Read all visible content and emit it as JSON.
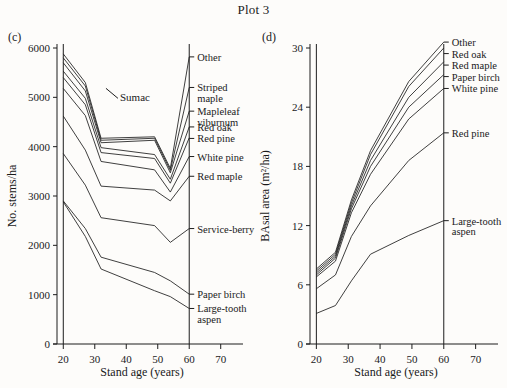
{
  "figure": {
    "title": "Plot 3",
    "panel_c_tag": "(c)",
    "panel_d_tag": "(d)"
  },
  "chart_data": [
    {
      "type": "line",
      "panel": "(c)",
      "title": "Plot 3",
      "xlabel": "Stand age (years)",
      "ylabel": "No. stems/ha",
      "xlim": [
        18,
        72
      ],
      "ylim": [
        0,
        6000
      ],
      "xticks": [
        20,
        30,
        40,
        50,
        60,
        70
      ],
      "yticks": [
        0,
        1000,
        2000,
        3000,
        4000,
        5000,
        6000
      ],
      "grid": false,
      "legend": "right-edge-labels",
      "annotations": [
        {
          "text": "Sumac",
          "x": 38,
          "y": 5000
        }
      ],
      "x": [
        20,
        27,
        32,
        49,
        54,
        60
      ],
      "series": [
        {
          "name": "Other",
          "label": "Other",
          "values": [
            5880,
            5300,
            4170,
            4200,
            3560,
            5820
          ]
        },
        {
          "name": "Striped maple",
          "label": "Striped maple",
          "values": [
            5800,
            5230,
            4130,
            4170,
            3520,
            5200
          ]
        },
        {
          "name": "Mapleleaf viburnum",
          "label": "Mapleleaf viburnum",
          "values": [
            5700,
            5130,
            4080,
            4130,
            3470,
            4720
          ]
        },
        {
          "name": "Red oak",
          "label": "Red oak",
          "values": [
            5530,
            4980,
            3980,
            3840,
            3340,
            4400
          ]
        },
        {
          "name": "Red pine",
          "label": "Red pine",
          "values": [
            5400,
            4850,
            3880,
            3760,
            3260,
            4180
          ]
        },
        {
          "name": "White pine",
          "label": "White pine",
          "values": [
            5180,
            4630,
            3700,
            3530,
            3080,
            3800
          ]
        },
        {
          "name": "Red maple",
          "label": "Red maple",
          "values": [
            4620,
            3930,
            3200,
            3120,
            2900,
            3400
          ]
        },
        {
          "name": "Serviceberry",
          "label": "Service-berry",
          "values": [
            3860,
            3220,
            2560,
            2400,
            2060,
            2340
          ]
        },
        {
          "name": "Paper birch",
          "label": "Paper birch",
          "values": [
            2900,
            2340,
            1760,
            1450,
            1280,
            1010
          ]
        },
        {
          "name": "Large-tooth aspen",
          "label": "Large-tooth aspen",
          "values": [
            2880,
            2180,
            1520,
            1080,
            960,
            720
          ]
        }
      ]
    },
    {
      "type": "line",
      "panel": "(d)",
      "title": "Plot 3",
      "xlabel": "Stand age (years)",
      "ylabel": "BAsal area (m²/ha)",
      "xlim": [
        18,
        72
      ],
      "ylim": [
        0,
        30
      ],
      "xticks": [
        20,
        30,
        40,
        50,
        60,
        70
      ],
      "yticks": [
        0,
        6,
        12,
        18,
        24,
        30
      ],
      "grid": false,
      "legend": "right-edge-labels",
      "annotations": [],
      "x": [
        20,
        26,
        31,
        37,
        49,
        60
      ],
      "series": [
        {
          "name": "Other",
          "label": "Other",
          "values": [
            7.6,
            9.3,
            14.6,
            19.6,
            26.6,
            30.6
          ]
        },
        {
          "name": "Red oak",
          "label": "Red oak",
          "values": [
            7.4,
            9.1,
            14.3,
            19.2,
            26.1,
            30.0
          ]
        },
        {
          "name": "Red maple",
          "label": "Red maple",
          "values": [
            7.2,
            8.9,
            14.0,
            18.6,
            25.0,
            28.6
          ]
        },
        {
          "name": "Paper birch",
          "label": "Paper birch",
          "values": [
            7.0,
            8.7,
            13.7,
            18.0,
            24.0,
            27.3
          ]
        },
        {
          "name": "White pine",
          "label": "White pine",
          "values": [
            6.8,
            8.4,
            13.3,
            17.2,
            22.8,
            25.9
          ]
        },
        {
          "name": "Red pine",
          "label": "Red pine",
          "values": [
            5.6,
            7.0,
            10.9,
            14.0,
            18.6,
            21.4
          ]
        },
        {
          "name": "Large-tooth aspen",
          "label": "Large-tooth aspen",
          "values": [
            3.1,
            3.9,
            6.4,
            9.1,
            11.0,
            12.5
          ]
        }
      ]
    }
  ]
}
